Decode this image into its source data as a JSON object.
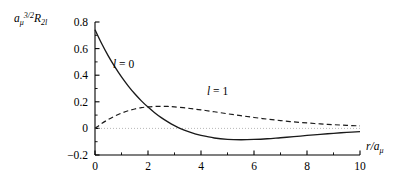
{
  "figure": {
    "background_color": "#ffffff",
    "line_color": "#1a1a1a",
    "axis_color": "#000000"
  },
  "axes": {
    "y_title_parts": {
      "base": "a",
      "base_sub": "μ",
      "base_sup": "3/2",
      "second": "R",
      "second_sub": "2l"
    },
    "x_title_parts": {
      "numerator": "r",
      "slash": "/",
      "denominator": "a",
      "denominator_sub": "μ"
    },
    "y_tick_labels": [
      "0.8",
      "0.6",
      "0.4",
      "0.2",
      "0",
      "−0.2"
    ],
    "y_tick_values": [
      0.8,
      0.6,
      0.4,
      0.2,
      0,
      -0.2
    ],
    "x_tick_labels": [
      "0",
      "2",
      "4",
      "6",
      "8",
      "10"
    ],
    "x_tick_values": [
      0,
      2,
      4,
      6,
      8,
      10
    ],
    "x_minor_ticks": [
      1,
      3,
      5,
      7,
      9
    ],
    "y_minor_ticks": [
      0.7,
      0.5,
      0.3,
      0.1,
      -0.1
    ]
  },
  "annotations": [
    {
      "name": "label-l-0",
      "text": "l = 0",
      "x_px": 113,
      "y_px": 68
    },
    {
      "name": "label-l-1",
      "text": "l = 1",
      "x_px": 207,
      "y_px": 95
    }
  ],
  "chart_data": {
    "type": "line",
    "title": "",
    "xlabel": "r/a_mu",
    "ylabel": "a_mu^{3/2} R_{2l}",
    "xlim": [
      0,
      10
    ],
    "ylim": [
      -0.2,
      0.8
    ],
    "grid": false,
    "legend_position": "inline-annotations",
    "series": [
      {
        "name": "l = 0",
        "label": "l = 0",
        "style": "solid",
        "color": "#1a1a1a",
        "x": [
          0,
          0.25,
          0.5,
          0.75,
          1.0,
          1.25,
          1.5,
          1.75,
          2.0,
          2.25,
          2.5,
          2.75,
          3.0,
          3.25,
          3.5,
          3.75,
          4.0,
          4.5,
          5.0,
          5.5,
          6.0,
          6.5,
          7.0,
          7.5,
          8.0,
          8.5,
          9.0,
          9.5,
          10.0
        ],
        "y": [
          0.742,
          0.638,
          0.545,
          0.462,
          0.387,
          0.32,
          0.26,
          0.207,
          0.16,
          0.118,
          0.081,
          0.049,
          0.021,
          -0.003,
          -0.023,
          -0.04,
          -0.053,
          -0.072,
          -0.082,
          -0.085,
          -0.083,
          -0.078,
          -0.07,
          -0.062,
          -0.053,
          -0.045,
          -0.037,
          -0.03,
          -0.024
        ]
      },
      {
        "name": "l = 1",
        "label": "l = 1",
        "style": "dashed",
        "color": "#1a1a1a",
        "x": [
          0,
          0.25,
          0.5,
          0.75,
          1.0,
          1.25,
          1.5,
          1.75,
          2.0,
          2.25,
          2.5,
          2.75,
          3.0,
          3.5,
          4.0,
          4.5,
          5.0,
          5.5,
          6.0,
          6.5,
          7.0,
          7.5,
          8.0,
          8.5,
          9.0,
          9.5,
          10.0
        ],
        "y": [
          0.0,
          0.036,
          0.067,
          0.093,
          0.115,
          0.133,
          0.146,
          0.156,
          0.162,
          0.165,
          0.166,
          0.165,
          0.162,
          0.152,
          0.139,
          0.125,
          0.11,
          0.096,
          0.082,
          0.07,
          0.059,
          0.049,
          0.041,
          0.034,
          0.028,
          0.023,
          0.019
        ]
      }
    ],
    "zero_reference_line": {
      "y": 0,
      "visible": true,
      "style": "dotted"
    }
  }
}
